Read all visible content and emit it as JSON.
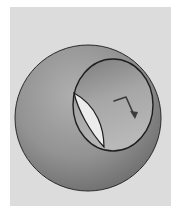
{
  "figure": {
    "colors": {
      "page_background": "#ffffff",
      "panel_background": "#dcdcdc",
      "sphere_light": "#a8a8a8",
      "sphere_dark": "#6e6e6e",
      "hole_interior_light": "#b4b4b4",
      "hole_interior_dark": "#7a7a7a",
      "see_through_opening": "#ececec",
      "outline": "#2a2a2a",
      "arrow": "#3a3a3a"
    },
    "arrow_label": "bent arrow"
  }
}
